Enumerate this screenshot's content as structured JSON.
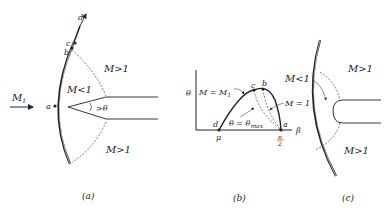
{
  "panels": {
    "a": {
      "caption": "(a)",
      "freestream_label": "M",
      "freestream_sub": "1",
      "point_a": "a",
      "point_b": "b",
      "point_c": "c",
      "point_d": "d",
      "region_upper": "M>1",
      "region_subsonic": "M<1",
      "region_lower": "M>1",
      "angle_label": "θ"
    },
    "b": {
      "caption": "(b)",
      "y_axis_label": "θ",
      "x_axis_label": "β",
      "curve_label": "M = M",
      "curve_label_sub": "1",
      "theta_max_label": "θ = θ",
      "theta_max_sub": "max",
      "sonic_label": "M = 1",
      "mach_angle_tick": "μ",
      "pi_over_two_top": "π",
      "pi_over_two_bottom": "2",
      "point_a": "a",
      "point_b": "b",
      "point_c": "c",
      "point_d": "d"
    },
    "c": {
      "caption": "(c)",
      "region_subsonic": "M<1",
      "region_upper": "M>1",
      "region_lower": "M>1"
    }
  }
}
